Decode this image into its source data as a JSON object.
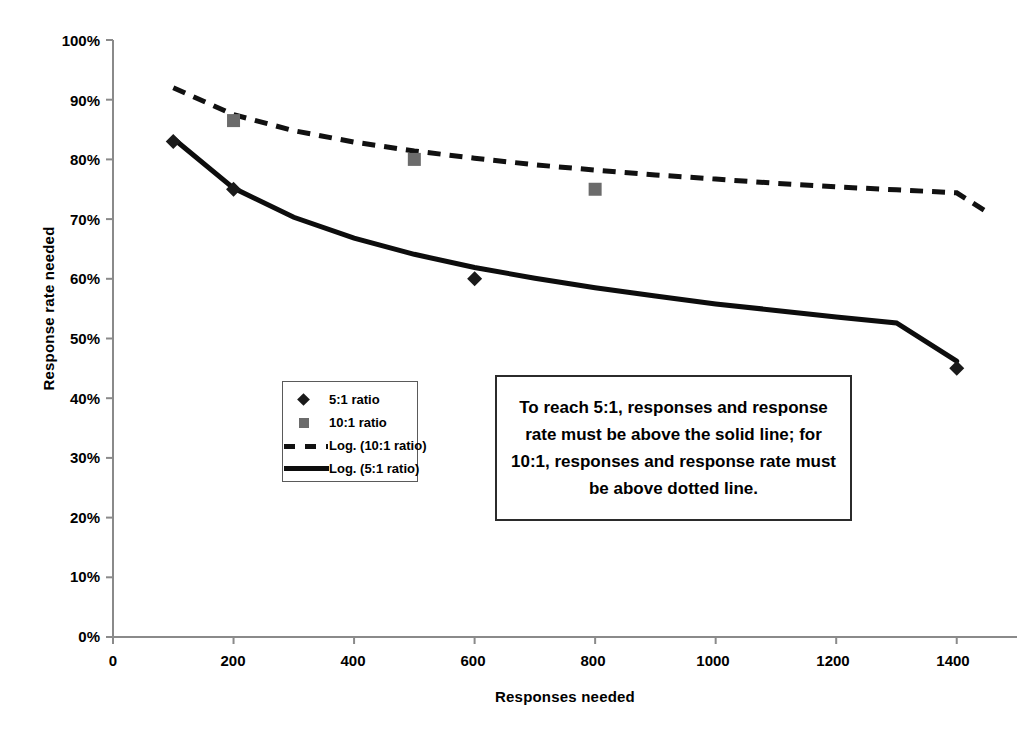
{
  "chart_data": {
    "type": "scatter",
    "title": "",
    "xlabel": "Responses needed",
    "ylabel": "Response rate needed",
    "xlim": [
      0,
      1500
    ],
    "ylim": [
      0,
      1.0
    ],
    "grid": false,
    "legend_position": "inside-left",
    "x_ticks": [
      0,
      200,
      400,
      600,
      800,
      1000,
      1200,
      1400
    ],
    "x_tick_labels": [
      "0",
      "200",
      "400",
      "600",
      "800",
      "1000",
      "1200",
      "1400"
    ],
    "y_ticks": [
      0,
      0.1,
      0.2,
      0.3,
      0.4,
      0.5,
      0.6,
      0.7,
      0.8,
      0.9,
      1.0
    ],
    "y_tick_labels": [
      "0%",
      "10%",
      "20%",
      "30%",
      "40%",
      "50%",
      "60%",
      "70%",
      "80%",
      "90%",
      "100%"
    ],
    "series": [
      {
        "name": "5:1 ratio",
        "marker": "diamond",
        "color": "#1a1a1a",
        "points": [
          {
            "x": 100,
            "y": 0.83
          },
          {
            "x": 200,
            "y": 0.75
          },
          {
            "x": 600,
            "y": 0.6
          },
          {
            "x": 1400,
            "y": 0.45
          }
        ]
      },
      {
        "name": "10:1 ratio",
        "marker": "square",
        "color": "#6b6b6b",
        "points": [
          {
            "x": 200,
            "y": 0.865
          },
          {
            "x": 500,
            "y": 0.8
          },
          {
            "x": 800,
            "y": 0.75
          }
        ]
      },
      {
        "name": "Log. (10:1 ratio)",
        "marker": "dashed-line",
        "color": "#111111",
        "points": [
          {
            "x": 100,
            "y": 0.92
          },
          {
            "x": 200,
            "y": 0.875
          },
          {
            "x": 300,
            "y": 0.848
          },
          {
            "x": 400,
            "y": 0.829
          },
          {
            "x": 500,
            "y": 0.814
          },
          {
            "x": 600,
            "y": 0.802
          },
          {
            "x": 700,
            "y": 0.791
          },
          {
            "x": 800,
            "y": 0.782
          },
          {
            "x": 900,
            "y": 0.774
          },
          {
            "x": 1000,
            "y": 0.767
          },
          {
            "x": 1100,
            "y": 0.76
          },
          {
            "x": 1200,
            "y": 0.754
          },
          {
            "x": 1300,
            "y": 0.749
          },
          {
            "x": 1400,
            "y": 0.744
          },
          {
            "x": 1450,
            "y": 0.712
          }
        ]
      },
      {
        "name": "Log. (5:1 ratio)",
        "marker": "solid-line",
        "color": "#0d0d0d",
        "points": [
          {
            "x": 100,
            "y": 0.835
          },
          {
            "x": 200,
            "y": 0.752
          },
          {
            "x": 300,
            "y": 0.703
          },
          {
            "x": 400,
            "y": 0.668
          },
          {
            "x": 500,
            "y": 0.641
          },
          {
            "x": 600,
            "y": 0.619
          },
          {
            "x": 700,
            "y": 0.601
          },
          {
            "x": 800,
            "y": 0.585
          },
          {
            "x": 900,
            "y": 0.571
          },
          {
            "x": 1000,
            "y": 0.558
          },
          {
            "x": 1100,
            "y": 0.547
          },
          {
            "x": 1200,
            "y": 0.536
          },
          {
            "x": 1300,
            "y": 0.526
          },
          {
            "x": 1400,
            "y": 0.462
          }
        ]
      }
    ],
    "annotation": "To reach 5:1, responses and response rate must be above the solid line; for 10:1, responses and response rate must be above dotted line."
  },
  "axes": {
    "x_title": "Responses needed",
    "y_title": "Response rate needed",
    "y_labels": [
      "100%",
      "90%",
      "80%",
      "70%",
      "60%",
      "50%",
      "40%",
      "30%",
      "20%",
      "10%",
      "0%"
    ],
    "x_labels": [
      "0",
      "200",
      "400",
      "600",
      "800",
      "1000",
      "1200",
      "1400"
    ]
  },
  "legend": {
    "items": [
      {
        "label": "5:1 ratio",
        "key": "diamond-marker-icon"
      },
      {
        "label": "10:1 ratio",
        "key": "square-marker-icon"
      },
      {
        "label": "Log. (10:1 ratio)",
        "key": "dashed-line-icon"
      },
      {
        "label": "Log. (5:1 ratio)",
        "key": "solid-line-icon"
      }
    ]
  },
  "annotation": {
    "text": "To reach 5:1, responses and response rate must be above the solid line; for 10:1, responses and response rate must be above dotted line."
  },
  "colors": {
    "series_5to1": "#1a1a1a",
    "series_10to1": "#6b6b6b",
    "axis": "#808080",
    "background": "#ffffff"
  }
}
